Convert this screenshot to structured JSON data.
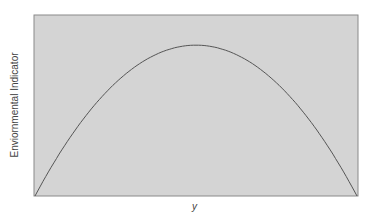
{
  "chart_data": {
    "type": "line",
    "title": "",
    "xlabel": "y",
    "ylabel": "Enviornmental Indicator",
    "grid": false,
    "legend": null,
    "plot_background": "#d4d4d4",
    "line_color": "#555555",
    "axis_ticks": "none",
    "shape": "inverted parabola (inverted-U)",
    "x": [
      0,
      0.1,
      0.2,
      0.3,
      0.4,
      0.5,
      0.6,
      0.7,
      0.8,
      0.9,
      1.0
    ],
    "series": [
      {
        "name": "curve",
        "values": [
          0.0,
          0.36,
          0.64,
          0.84,
          0.96,
          1.0,
          0.96,
          0.84,
          0.64,
          0.36,
          0.01
        ]
      }
    ],
    "xlim": [
      0,
      1
    ],
    "ylim": [
      0,
      1.2
    ]
  }
}
